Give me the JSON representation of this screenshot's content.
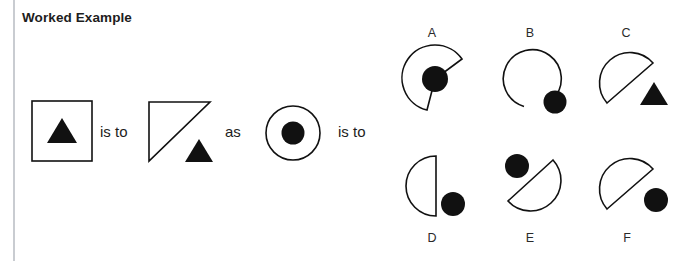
{
  "page": {
    "title": "Worked Example",
    "background_color": "#ffffff",
    "ink_color": "#111111",
    "rule_color": "#c9ccd1"
  },
  "analogy": {
    "connector_1": "is to",
    "connector_2": "as",
    "connector_3": "is to",
    "prompt_pair": {
      "source": {
        "name": "square-with-triangle",
        "outer_shape": "square",
        "inner_shape": "triangle",
        "inner_fill": "solid-black",
        "inner_position": "inside-center"
      },
      "result": {
        "name": "half-square-triangle-with-triangle",
        "outer_shape": "triangle-half-of-square",
        "inner_shape": "triangle",
        "inner_fill": "solid-black",
        "inner_position": "outside-bottom-right"
      }
    },
    "query": {
      "name": "circle-with-dot",
      "outer_shape": "circle",
      "inner_shape": "dot",
      "inner_fill": "solid-black",
      "inner_position": "inside-center"
    }
  },
  "options": [
    {
      "id": "A",
      "label": "A",
      "outer_shape": "pac-man-wedge",
      "inner_shape": "dot",
      "inner_fill": "solid-black",
      "inner_position": "center"
    },
    {
      "id": "B",
      "label": "B",
      "outer_shape": "circle-with-small-gap",
      "inner_shape": "dot",
      "inner_fill": "solid-black",
      "inner_position": "on-perimeter-bottom-right"
    },
    {
      "id": "C",
      "label": "C",
      "outer_shape": "half-circle-diagonal",
      "inner_shape": "triangle",
      "inner_fill": "solid-black",
      "inner_position": "outside-bottom-right"
    },
    {
      "id": "D",
      "label": "D",
      "outer_shape": "half-circle-left",
      "inner_shape": "dot",
      "inner_fill": "solid-black",
      "inner_position": "outside-bottom-right"
    },
    {
      "id": "E",
      "label": "E",
      "outer_shape": "half-circle-diagonal-flipped",
      "inner_shape": "dot",
      "inner_fill": "solid-black",
      "inner_position": "outside-top-left"
    },
    {
      "id": "F",
      "label": "F",
      "outer_shape": "half-circle-diagonal",
      "inner_shape": "dot",
      "inner_fill": "solid-black",
      "inner_position": "outside-bottom-right"
    }
  ]
}
